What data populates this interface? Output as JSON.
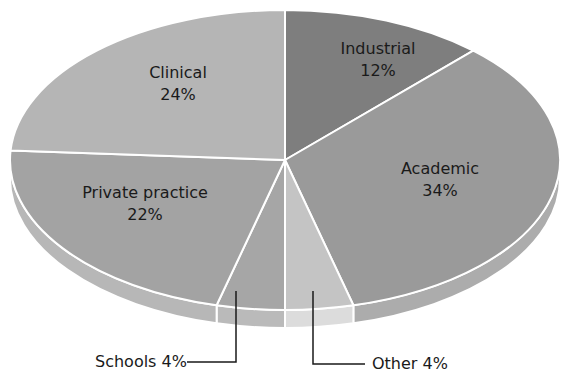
{
  "chart_data": {
    "type": "pie",
    "style": "3d-tilted",
    "title": "",
    "categories": [
      "Industrial",
      "Academic",
      "Other",
      "Schools",
      "Private practice",
      "Clinical"
    ],
    "values": [
      12,
      34,
      4,
      4,
      22,
      24
    ],
    "unit": "%",
    "colors": [
      "#7e7e7e",
      "#9a9a9a",
      "#c4c4c4",
      "#a6a6a6",
      "#a3a3a3",
      "#b5b5b5"
    ],
    "labels": [
      {
        "name": "Industrial",
        "pct": "12%",
        "placement": "inside"
      },
      {
        "name": "Academic",
        "pct": "34%",
        "placement": "inside"
      },
      {
        "name": "Other",
        "pct": "4%",
        "placement": "callout"
      },
      {
        "name": "Schools",
        "pct": "4%",
        "placement": "callout"
      },
      {
        "name": "Private practice",
        "pct": "22%",
        "placement": "inside"
      },
      {
        "name": "Clinical",
        "pct": "24%",
        "placement": "inside"
      }
    ],
    "legend": "none"
  },
  "labels": {
    "industrial": {
      "name": "Industrial",
      "pct": "12%"
    },
    "academic": {
      "name": "Academic",
      "pct": "34%"
    },
    "clinical": {
      "name": "Clinical",
      "pct": "24%"
    },
    "private": {
      "name": "Private practice",
      "pct": "22%"
    },
    "schools": "Schools 4%",
    "other": "Other 4%"
  }
}
